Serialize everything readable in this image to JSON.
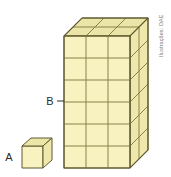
{
  "figure": {
    "background_color": "#ffffff",
    "labels": {
      "small_solid": "A",
      "large_solid": "B"
    },
    "credit": "Ilustrações: DAE",
    "palette": {
      "front_face": "#f7f2c0",
      "top_face": "#ece5a8",
      "side_face": "#efe8ad",
      "edge_line": "#8a8248",
      "outline": "#5f5a30",
      "label_color": "#2b2b2b",
      "credit_color": "#7d7d7d"
    },
    "solids": [
      {
        "name": "unit-cube",
        "label": "A",
        "columns": 1,
        "depth": 1,
        "rows": 1,
        "unit_count": 1
      },
      {
        "name": "rectangular-prism",
        "label": "B",
        "columns": 3,
        "depth": 2,
        "rows": 6,
        "unit_count": 36
      }
    ]
  }
}
